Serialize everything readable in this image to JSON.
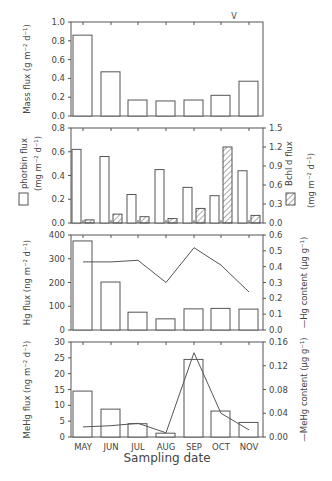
{
  "figure": {
    "xlabel": "Sampling date",
    "months": [
      "MAY",
      "JUN",
      "JUL",
      "AUG",
      "SEP",
      "OCT",
      "NOV"
    ],
    "marker_v": "V",
    "marker_v_month_index": 5
  },
  "chart_data": [
    {
      "type": "bar",
      "title": "",
      "categories": [
        "MAY",
        "JUN",
        "JUL",
        "AUG",
        "SEP",
        "OCT",
        "NOV"
      ],
      "values": [
        0.86,
        0.47,
        0.17,
        0.16,
        0.17,
        0.22,
        0.37
      ],
      "ylabel": "Mass flux (g m^-2 d^-1)",
      "ylim": [
        0,
        1.0
      ],
      "yticks": [
        0.0,
        0.2,
        0.4,
        0.6,
        0.8,
        1.0
      ],
      "ytick_labels": [
        "0.0",
        "0.2",
        "0.4",
        "0.6",
        "0.8",
        "1.0"
      ],
      "annotation": "V above OCT"
    },
    {
      "type": "bar",
      "categories": [
        "MAY",
        "JUN",
        "JUL",
        "AUG",
        "SEP",
        "OCT",
        "NOV"
      ],
      "series": [
        {
          "name": "phorbin flux",
          "axis": "left",
          "pattern": "open",
          "values": [
            0.62,
            0.56,
            0.24,
            0.45,
            0.3,
            0.23,
            0.44
          ]
        },
        {
          "name": "Bchl d flux",
          "axis": "right",
          "pattern": "hatched",
          "values": [
            0.05,
            0.14,
            0.1,
            0.07,
            0.23,
            1.2,
            0.12
          ]
        }
      ],
      "ylabel": "phorbin flux (mg m^-2 d^-1)",
      "ylabel_right": "Bchl d flux (mg m^-2 d^-1)",
      "ylim": [
        0,
        0.8
      ],
      "ylim_right": [
        0,
        1.5
      ],
      "yticks": [
        "0.0",
        "0.2",
        "0.4",
        "0.6",
        "0.8"
      ],
      "yticks_right": [
        "0.0",
        "0.3",
        "0.6",
        "0.9",
        "1.2",
        "1.5"
      ],
      "legend": [
        "phorbin flux (open box, left)",
        "Bchl d flux (hatched box, right)"
      ]
    },
    {
      "type": "bar",
      "categories": [
        "MAY",
        "JUN",
        "JUL",
        "AUG",
        "SEP",
        "OCT",
        "NOV"
      ],
      "series": [
        {
          "name": "Hg flux",
          "axis": "left",
          "kind": "bar",
          "values": [
            375,
            202,
            75,
            47,
            89,
            91,
            88
          ]
        },
        {
          "name": "Hg content",
          "axis": "right",
          "kind": "line",
          "values": [
            0.43,
            0.43,
            0.44,
            0.3,
            0.52,
            0.41,
            0.24
          ]
        }
      ],
      "ylabel": "Hg flux (ng m^-2 d^-1)",
      "ylabel_right": "—Hg content (μg g^-1)",
      "ylim": [
        0,
        400
      ],
      "ylim_right": [
        0,
        0.6
      ],
      "yticks": [
        "0",
        "100",
        "200",
        "300",
        "400"
      ],
      "yticks_right": [
        "0.0",
        "0.1",
        "0.2",
        "0.3",
        "0.4",
        "0.5",
        "0.6"
      ]
    },
    {
      "type": "bar",
      "categories": [
        "MAY",
        "JUN",
        "JUL",
        "AUG",
        "SEP",
        "OCT",
        "NOV"
      ],
      "series": [
        {
          "name": "MeHg flux",
          "axis": "left",
          "kind": "bar",
          "values": [
            14.5,
            8.8,
            4.2,
            1.2,
            24.5,
            8.2,
            4.6
          ]
        },
        {
          "name": "MeHg content",
          "axis": "right",
          "kind": "line",
          "values": [
            0.017,
            0.019,
            0.023,
            0.007,
            0.142,
            0.04,
            0.012
          ]
        }
      ],
      "ylabel": "MeHg flux (ng m^-2 d^-1)",
      "ylabel_right": "—MeHg content (μg g^-1)",
      "ylim": [
        0,
        30
      ],
      "ylim_right": [
        0,
        0.16
      ],
      "yticks": [
        "0",
        "5",
        "10",
        "15",
        "20",
        "25",
        "30"
      ],
      "yticks_right": [
        "0.00",
        "0.04",
        "0.08",
        "0.12",
        "0.16"
      ],
      "xlabel": "Sampling date"
    }
  ]
}
